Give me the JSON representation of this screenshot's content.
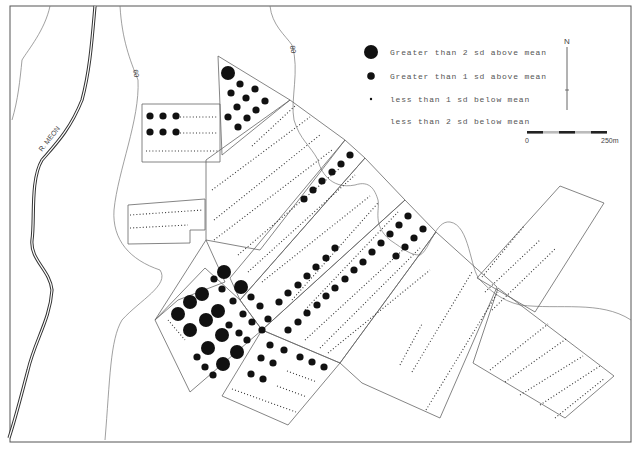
{
  "map": {
    "river_label": "R. MEON",
    "contour_labels": [
      "60",
      "80"
    ],
    "north_label": "N",
    "scale": {
      "start": "0",
      "end": "250m"
    },
    "legend": [
      {
        "symbol": "large-dot",
        "label": "Greater than 2 sd above mean"
      },
      {
        "symbol": "medium-dot",
        "label": "Greater than 1 sd above mean"
      },
      {
        "symbol": "small-dot",
        "label": "less than 1 sd below mean"
      },
      {
        "symbol": "none",
        "label": "less than 2 sd below mean"
      }
    ],
    "colors": {
      "ink": "#111111",
      "line": "#666666",
      "background": "#ffffff"
    }
  }
}
